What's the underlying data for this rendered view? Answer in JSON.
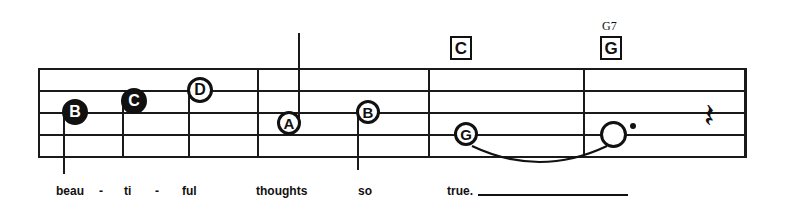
{
  "sheet": {
    "title": "Lead sheet staff excerpt",
    "ink_color": "#111111",
    "background_color": "#ffffff"
  },
  "staff": {
    "line_count": 5,
    "left": 38,
    "right": 746,
    "top": 68,
    "bottom": 158,
    "line_ys": [
      68,
      90,
      112,
      134,
      156
    ],
    "barlines": [
      {
        "name": "barline-measure-1-2",
        "x": 257
      },
      {
        "name": "barline-measure-2-3",
        "x": 428
      },
      {
        "name": "barline-measure-3-4",
        "x": 583
      },
      {
        "name": "barline-final",
        "x": 744
      }
    ]
  },
  "chords": [
    {
      "id": "chord-c",
      "label": "C",
      "superscript": "",
      "x": 450,
      "y": 36
    },
    {
      "id": "chord-g",
      "label": "G",
      "superscript": "G7",
      "x": 600,
      "y": 36
    }
  ],
  "notes": [
    {
      "id": "note-1",
      "letter": "B",
      "head": "filled",
      "stem": "down",
      "x": 75,
      "y": 112,
      "size": 26,
      "stem_length": 62
    },
    {
      "id": "note-2",
      "letter": "C",
      "head": "filled",
      "stem": "down",
      "x": 134,
      "y": 101,
      "size": 26,
      "stem_length": 56
    },
    {
      "id": "note-3",
      "letter": "D",
      "head": "open",
      "stem": "down",
      "x": 200,
      "y": 90,
      "size": 26,
      "stem_length": 68
    },
    {
      "id": "note-4",
      "letter": "A",
      "head": "open",
      "stem": "up",
      "x": 289,
      "y": 123,
      "size": 24,
      "stem_length": 90
    },
    {
      "id": "note-5",
      "letter": "B",
      "head": "open",
      "stem": "down",
      "x": 368,
      "y": 112,
      "size": 24,
      "stem_length": 58
    },
    {
      "id": "note-6",
      "letter": "G",
      "head": "open",
      "stem": "none",
      "x": 466,
      "y": 134,
      "size": 24,
      "stem_length": 0
    },
    {
      "id": "note-7",
      "letter": "",
      "head": "plain",
      "stem": "none",
      "x": 613,
      "y": 134,
      "size": 27,
      "stem_length": 0,
      "dotted": true
    }
  ],
  "tie": {
    "id": "tie-g-to-held-note",
    "from_x": 466,
    "to_x": 613,
    "y": 146,
    "depth": 16
  },
  "rest": {
    "id": "quarter-rest",
    "symbol": "𝄽",
    "glyph_fallback": "⸺",
    "label": "quarter rest",
    "x": 704,
    "y": 98,
    "size": 34
  },
  "lyrics": {
    "syllables": [
      {
        "id": "lyric-beau",
        "text": "beau",
        "x": 56,
        "y": 185
      },
      {
        "id": "lyric-dash-1",
        "text": "-",
        "x": 99,
        "y": 185,
        "is_dash": true
      },
      {
        "id": "lyric-ti",
        "text": "ti",
        "x": 124,
        "y": 185
      },
      {
        "id": "lyric-dash-2",
        "text": "-",
        "x": 155,
        "y": 185,
        "is_dash": true
      },
      {
        "id": "lyric-ful",
        "text": "ful",
        "x": 182,
        "y": 185
      },
      {
        "id": "lyric-thoughts",
        "text": "thoughts",
        "x": 256,
        "y": 185
      },
      {
        "id": "lyric-so",
        "text": "so",
        "x": 358,
        "y": 185
      },
      {
        "id": "lyric-true",
        "text": "true.",
        "x": 447,
        "y": 185
      }
    ],
    "melisma_line": {
      "id": "melisma-true",
      "x": 478,
      "y": 194,
      "width": 150
    }
  }
}
